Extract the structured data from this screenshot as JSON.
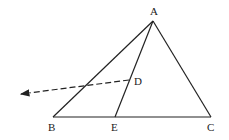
{
  "diagram": {
    "type": "geometry-triangle",
    "points": {
      "A": {
        "label": "A",
        "x": 153,
        "y": 21,
        "lx": 150,
        "ly": 15
      },
      "B": {
        "label": "B",
        "x": 53,
        "y": 117,
        "lx": 48,
        "ly": 131
      },
      "C": {
        "label": "C",
        "x": 211,
        "y": 117,
        "lx": 207,
        "ly": 131
      },
      "D": {
        "label": "D",
        "x": 129,
        "y": 80,
        "lx": 134,
        "ly": 85
      },
      "E": {
        "label": "E",
        "x": 115,
        "y": 117,
        "lx": 111,
        "ly": 131
      }
    },
    "segments": [
      {
        "from": "A",
        "to": "B",
        "style": "solid"
      },
      {
        "from": "A",
        "to": "C",
        "style": "solid"
      },
      {
        "from": "B",
        "to": "C",
        "style": "solid"
      },
      {
        "from": "A",
        "to": "E",
        "style": "solid"
      }
    ],
    "ray": {
      "from": "D",
      "to_x": 19,
      "to_y": 94,
      "style": "dashed",
      "arrow": true
    },
    "colors": {
      "stroke": "#222222",
      "background": "#ffffff"
    }
  }
}
